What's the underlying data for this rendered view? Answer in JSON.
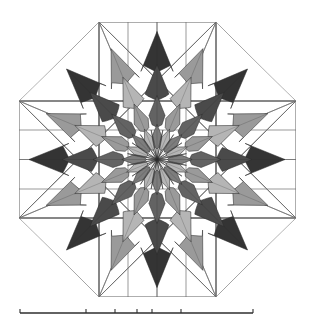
{
  "figure": {
    "background_color": "#ffffff",
    "canvas": {
      "width": 314,
      "height": 319
    }
  },
  "palette": {
    "outline": "#2b2b2b",
    "guide_line": "#6e6e6e",
    "guide_line_strong": "#4a4a4a",
    "baseline": "#2e2e2e",
    "shade_darkest": "#343434",
    "shade_dark": "#4a4a4a",
    "shade_mid_dark": "#636363",
    "shade_mid": "#7d7d7d",
    "shade_light": "#9a9a9a",
    "shade_lightest": "#b5b5b5",
    "shade_white": "#ffffff"
  },
  "octagon": {
    "name": "outer-octagon",
    "center": {
      "x": 157,
      "y": 159.5
    },
    "circumradius": 89,
    "vertices": [
      {
        "x": 99,
        "y": 22
      },
      {
        "x": 216,
        "y": 22
      },
      {
        "x": 296,
        "y": 101
      },
      {
        "x": 296,
        "y": 218
      },
      {
        "x": 216,
        "y": 297
      },
      {
        "x": 99,
        "y": 297
      },
      {
        "x": 19,
        "y": 218
      },
      {
        "x": 19,
        "y": 101
      }
    ]
  },
  "inner_square": {
    "name": "inner-square",
    "vertices": [
      {
        "x": 99,
        "y": 101
      },
      {
        "x": 216,
        "y": 101
      },
      {
        "x": 216,
        "y": 218
      },
      {
        "x": 99,
        "y": 218
      }
    ]
  },
  "star": {
    "name": "radiating-star",
    "point_count": 16,
    "layers": 4,
    "cardinal_tip_radius": 128,
    "diagonal_tip_radius": 120,
    "notes": "Sixteen chevron rays alternating light and dark gray, arranged in four concentric rings of nested arrow heads."
  },
  "chart_data": {
    "type": "pie",
    "xlabel": "",
    "ylabel": "",
    "legend_position": "none",
    "grid": true,
    "categories": [
      "ray-00-N",
      "ray-01-NNE",
      "ray-02-NE",
      "ray-03-ENE",
      "ray-04-E",
      "ray-05-ESE",
      "ray-06-SE",
      "ray-07-SSE",
      "ray-08-S",
      "ray-09-SSW",
      "ray-10-SW",
      "ray-11-WSW",
      "ray-12-W",
      "ray-13-WNW",
      "ray-14-NW",
      "ray-15-NNW"
    ],
    "values": [
      22.5,
      22.5,
      22.5,
      22.5,
      22.5,
      22.5,
      22.5,
      22.5,
      22.5,
      22.5,
      22.5,
      22.5,
      22.5,
      22.5,
      22.5,
      22.5
    ],
    "series": [
      {
        "name": "ray-tip-radius-px",
        "values": [
          128,
          120,
          128,
          120,
          128,
          120,
          128,
          120,
          128,
          120,
          128,
          120,
          128,
          120,
          128,
          120
        ]
      },
      {
        "name": "ray-shade",
        "values": [
          "#4a4a4a",
          "#9a9a9a",
          "#4a4a4a",
          "#9a9a9a",
          "#4a4a4a",
          "#9a9a9a",
          "#4a4a4a",
          "#9a9a9a",
          "#4a4a4a",
          "#9a9a9a",
          "#4a4a4a",
          "#9a9a9a",
          "#4a4a4a",
          "#9a9a9a",
          "#4a4a4a",
          "#9a9a9a"
        ]
      }
    ],
    "ring_radii": [
      34,
      62,
      92,
      124
    ],
    "ring_shades_dark_rays": [
      "#7d7d7d",
      "#636363",
      "#4a4a4a",
      "#343434"
    ],
    "ring_shades_light_rays": [
      "#b5b5b5",
      "#9a9a9a",
      "#b5b5b5",
      "#9a9a9a"
    ],
    "xlim": [
      19,
      296
    ],
    "ylim": [
      22,
      297
    ]
  },
  "baseline": {
    "name": "bottom-rule",
    "x_start": 20,
    "x_end": 253,
    "y": 313,
    "tick_positions": [
      20,
      86,
      115,
      137,
      152,
      181,
      253
    ]
  }
}
